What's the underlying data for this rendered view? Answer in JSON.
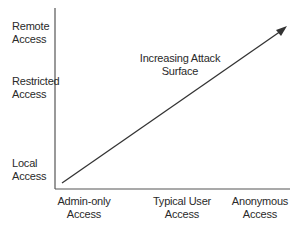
{
  "diagram": {
    "title_annotation": {
      "line1": "Increasing Attack",
      "line2": "Surface"
    },
    "y_axis": {
      "labels": [
        {
          "line1": "Remote",
          "line2": "Access"
        },
        {
          "line1": "Restricted",
          "line2": "Access"
        },
        {
          "line1": "Local",
          "line2": "Access"
        }
      ]
    },
    "x_axis": {
      "labels": [
        {
          "line1": "Admin-only",
          "line2": "Access"
        },
        {
          "line1": "Typical User",
          "line2": "Access"
        },
        {
          "line1": "Anonymous",
          "line2": "Access"
        }
      ]
    },
    "colors": {
      "axis": "#555555",
      "arrow": "#333333",
      "text": "#2a2a2a"
    }
  }
}
